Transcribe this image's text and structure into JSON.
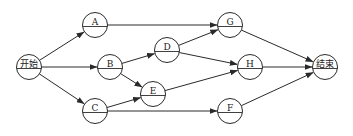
{
  "diagram": {
    "type": "network-diagram",
    "colors": {
      "stroke": "#2a2a2a",
      "background": "#ffffff",
      "text": "#222222"
    },
    "node_radius": 12.5,
    "nodes": [
      {
        "id": "start",
        "label": "开始",
        "x": 29,
        "y": 67
      },
      {
        "id": "A",
        "label": "A",
        "x": 95,
        "y": 25
      },
      {
        "id": "B",
        "label": "B",
        "x": 110,
        "y": 67
      },
      {
        "id": "C",
        "label": "C",
        "x": 95,
        "y": 111
      },
      {
        "id": "D",
        "label": "D",
        "x": 167,
        "y": 50
      },
      {
        "id": "E",
        "label": "E",
        "x": 153,
        "y": 94
      },
      {
        "id": "G",
        "label": "G",
        "x": 230,
        "y": 25
      },
      {
        "id": "H",
        "label": "H",
        "x": 250,
        "y": 67
      },
      {
        "id": "F",
        "label": "F",
        "x": 230,
        "y": 111
      },
      {
        "id": "end",
        "label": "结束",
        "x": 325,
        "y": 67
      }
    ],
    "edges": [
      {
        "from": "start",
        "to": "A"
      },
      {
        "from": "start",
        "to": "B"
      },
      {
        "from": "start",
        "to": "C"
      },
      {
        "from": "A",
        "to": "G"
      },
      {
        "from": "B",
        "to": "D"
      },
      {
        "from": "B",
        "to": "E"
      },
      {
        "from": "C",
        "to": "E"
      },
      {
        "from": "C",
        "to": "F"
      },
      {
        "from": "D",
        "to": "G"
      },
      {
        "from": "D",
        "to": "H"
      },
      {
        "from": "E",
        "to": "H"
      },
      {
        "from": "G",
        "to": "end"
      },
      {
        "from": "H",
        "to": "end"
      },
      {
        "from": "F",
        "to": "end"
      }
    ]
  }
}
